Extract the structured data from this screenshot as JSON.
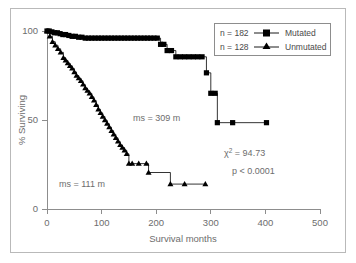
{
  "chart_data": {
    "type": "line",
    "title": "",
    "xlabel": "Survival months",
    "ylabel": "% Surviving",
    "xlim": [
      0,
      500
    ],
    "ylim": [
      0,
      100
    ],
    "xticks": [
      "0",
      "100",
      "200",
      "300",
      "400",
      "500"
    ],
    "xtick_values": [
      0,
      100,
      200,
      300,
      400,
      500
    ],
    "yticks": [
      "0",
      "50",
      "100"
    ],
    "ytick_values": [
      0,
      50,
      100
    ],
    "grid": false,
    "legend_position": "top-right",
    "series": [
      {
        "name": "Mutated",
        "n_label": "n = 182",
        "n": 182,
        "marker": "square",
        "color": "#000000",
        "median_survival_label": "ms = 309 m",
        "median_survival": 309,
        "x": [
          0,
          4,
          9,
          14,
          19,
          24,
          29,
          34,
          40,
          46,
          52,
          58,
          64,
          70,
          76,
          82,
          88,
          94,
          100,
          106,
          112,
          118,
          124,
          130,
          136,
          142,
          148,
          154,
          160,
          166,
          172,
          178,
          184,
          190,
          196,
          202,
          208,
          214,
          220,
          228,
          236,
          244,
          252,
          260,
          268,
          276,
          284,
          292,
          300,
          308,
          312,
          340,
          402
        ],
        "y": [
          100,
          100,
          99.5,
          99,
          99,
          98.5,
          98,
          98,
          97.5,
          97,
          97,
          96.5,
          96.5,
          96,
          96,
          96,
          96,
          96,
          96,
          96,
          96,
          96,
          96,
          96,
          96,
          96,
          96,
          96,
          96,
          96,
          96,
          96,
          96,
          96,
          96,
          96,
          92.5,
          92.5,
          89,
          89,
          85.5,
          85.5,
          85.5,
          85.5,
          85.5,
          85.5,
          85.5,
          76.5,
          65,
          65,
          48.5,
          48.5,
          48.5
        ]
      },
      {
        "name": "Unmutated",
        "n_label": "n = 128",
        "n": 128,
        "marker": "triangle",
        "color": "#000000",
        "median_survival_label": "ms = 111 m",
        "median_survival": 111,
        "x": [
          0,
          5,
          10,
          15,
          20,
          25,
          30,
          34,
          38,
          42,
          46,
          50,
          54,
          58,
          62,
          66,
          70,
          74,
          78,
          82,
          86,
          90,
          94,
          98,
          102,
          106,
          110,
          114,
          118,
          122,
          126,
          130,
          134,
          138,
          142,
          146,
          150,
          156,
          168,
          182,
          186,
          226,
          252,
          290
        ],
        "y": [
          100,
          97,
          94,
          92,
          90,
          88,
          85,
          83.5,
          82,
          80.5,
          79,
          77,
          75,
          73.5,
          72,
          70,
          68,
          66.5,
          65,
          63,
          61,
          58.5,
          56,
          54,
          52,
          50,
          48,
          46,
          44,
          42,
          40,
          38,
          36,
          34.5,
          33,
          31,
          25.5,
          25.5,
          25.5,
          25.5,
          20.5,
          14,
          14,
          14
        ]
      }
    ],
    "annotations": [
      {
        "id": "median-mutated",
        "text": "ms = 309 m",
        "x": 150,
        "y": 50
      },
      {
        "id": "median-unmutated",
        "text": "ms = 111 m",
        "x": 60,
        "y": 15
      },
      {
        "id": "chi-square",
        "prefix": "χ",
        "superscript": "2",
        "suffix": " = 94.73",
        "text": "χ² = 94.73"
      },
      {
        "id": "p-value",
        "text": "p < 0.0001"
      }
    ]
  },
  "legend": {
    "entries": [
      {
        "n_label": "n = 182",
        "name": "Mutated",
        "marker": "square"
      },
      {
        "n_label": "n = 128",
        "name": "Unmutated",
        "marker": "triangle"
      }
    ]
  },
  "axes": {
    "x_title": "Survival months",
    "y_title": "% Surviving",
    "x_tick_0": "0",
    "x_tick_1": "100",
    "x_tick_2": "200",
    "x_tick_3": "300",
    "x_tick_4": "400",
    "x_tick_5": "500",
    "y_tick_0": "0",
    "y_tick_1": "50",
    "y_tick_2": "100"
  },
  "stats": {
    "chi_square": "χ",
    "chi_square_exp": "2",
    "chi_square_value": " = 94.73",
    "p_value": "p < 0.0001"
  },
  "medians": {
    "mutated": "ms = 309 m",
    "unmutated": "ms = 111 m"
  },
  "colors": {
    "curve": "#000000",
    "axis": "#8d8d8d",
    "text": "#6d6d6d",
    "frame": "#b9b9b9",
    "background": "#ffffff"
  }
}
